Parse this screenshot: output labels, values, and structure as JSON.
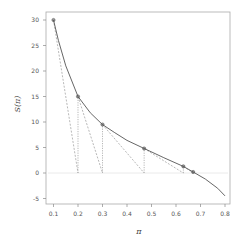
{
  "chart_data": {
    "type": "line",
    "title": "",
    "xlabel": "π",
    "ylabel": "S(π)",
    "xlim": [
      0.07,
      0.83
    ],
    "ylim": [
      -6.2,
      31.5
    ],
    "x_ticks": [
      0.1,
      0.2,
      0.3,
      0.4,
      0.5,
      0.6,
      0.7,
      0.8
    ],
    "x_tick_labels": [
      "0.1",
      "0.2",
      "0.3",
      "0.4",
      "0.5",
      "0.6",
      "0.7",
      "0.8"
    ],
    "y_ticks": [
      -5,
      0,
      5,
      10,
      15,
      20,
      25,
      30
    ],
    "y_tick_labels": [
      "-5",
      "0",
      "5",
      "10",
      "15",
      "20",
      "25",
      "30"
    ],
    "grid": false,
    "legend": null,
    "series": [
      {
        "name": "S(π)",
        "style": "solid",
        "x": [
          0.1,
          0.12,
          0.15,
          0.2,
          0.25,
          0.3,
          0.35,
          0.4,
          0.47,
          0.55,
          0.63,
          0.67,
          0.72,
          0.77,
          0.8
        ],
        "y": [
          30,
          26,
          21,
          15,
          11.8,
          9.5,
          7.9,
          6.4,
          4.8,
          3.0,
          1.3,
          0.2,
          -1.2,
          -3.0,
          -4.5
        ]
      },
      {
        "name": "iterates",
        "style": "markers",
        "x": [
          0.1,
          0.2,
          0.3,
          0.47,
          0.63,
          0.67
        ],
        "y": [
          30,
          15,
          9.5,
          4.8,
          1.3,
          0.2
        ]
      }
    ],
    "reference_line": {
      "y": 0,
      "style": "faint horizontal"
    },
    "tangent_steps": [
      {
        "from": [
          0.1,
          30
        ],
        "to": [
          0.2,
          0
        ]
      },
      {
        "from": [
          0.2,
          15
        ],
        "to": [
          0.3,
          0
        ]
      },
      {
        "from": [
          0.3,
          9.5
        ],
        "to": [
          0.47,
          0
        ]
      },
      {
        "from": [
          0.47,
          4.8
        ],
        "to": [
          0.63,
          0
        ]
      },
      {
        "from": [
          0.63,
          1.3
        ],
        "to": [
          0.67,
          0
        ]
      }
    ],
    "colors": {
      "curve": "#555555",
      "dashed": "#999999",
      "marker": "#555555",
      "axis": "#888888"
    }
  }
}
